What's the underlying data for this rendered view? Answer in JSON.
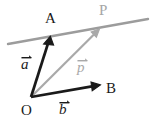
{
  "figure": {
    "type": "vector-diagram",
    "width": 156,
    "height": 123,
    "background_color": "#ffffff"
  },
  "colors": {
    "black": "#1a1a1a",
    "gray": "#a9a9a9",
    "line_gray": "#9c9c9c",
    "background": "#ffffff"
  },
  "points": {
    "O": {
      "label": "O",
      "x": 31,
      "y": 97,
      "color": "#1a1a1a"
    },
    "A": {
      "label": "A",
      "x": 50,
      "y": 37,
      "color": "#1a1a1a"
    },
    "B": {
      "label": "B",
      "x": 100,
      "y": 85,
      "color": "#1a1a1a"
    },
    "P": {
      "label": "P",
      "x": 99,
      "y": 29,
      "color": "#a6a6a6"
    }
  },
  "vectors": [
    {
      "name": "vector-a",
      "label": "a",
      "accent": "arrow",
      "color": "#1a1a1a",
      "from": [
        31,
        97
      ],
      "to": [
        50,
        37
      ],
      "stroke_width": 2.6,
      "label_pos": [
        21,
        57
      ]
    },
    {
      "name": "vector-b",
      "label": "b",
      "accent": "arrow",
      "color": "#1a1a1a",
      "from": [
        31,
        97
      ],
      "to": [
        100,
        85
      ],
      "stroke_width": 2.6,
      "label_pos": [
        59,
        102
      ]
    },
    {
      "name": "vector-p",
      "label": "p",
      "accent": "arrow",
      "color": "#a9a9a9",
      "from": [
        31,
        97
      ],
      "to": [
        99,
        29
      ],
      "stroke_width": 2.2,
      "label_pos": [
        77,
        60
      ]
    }
  ],
  "lines": [
    {
      "name": "line-through-A-and-P",
      "color": "#9c9c9c",
      "from": [
        8,
        44
      ],
      "to": [
        148,
        19
      ],
      "stroke_width": 2.4
    }
  ],
  "labels": {
    "A": "A",
    "B": "B",
    "O": "O",
    "P": "P",
    "a": "a",
    "b": "b",
    "p": "p"
  }
}
